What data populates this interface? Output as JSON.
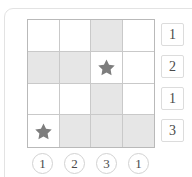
{
  "colors": {
    "cell_shaded": "#e6e6e6",
    "cell_empty": "#ffffff",
    "grid_line": "#c9c9c9",
    "grid_border": "#b9b9b9",
    "star_fill": "#7d7d7d",
    "label_text": "#4a4a4a",
    "card_border": "#e3e3e3"
  },
  "puzzle": {
    "rows": 4,
    "cols": 4,
    "star_icon_name": "star-icon",
    "row_labels": [
      "1",
      "2",
      "1",
      "3"
    ],
    "col_labels": [
      "1",
      "2",
      "3",
      "1"
    ],
    "cells": [
      [
        {
          "shaded": false,
          "star": false
        },
        {
          "shaded": false,
          "star": false
        },
        {
          "shaded": true,
          "star": false
        },
        {
          "shaded": false,
          "star": false
        }
      ],
      [
        {
          "shaded": true,
          "star": false
        },
        {
          "shaded": true,
          "star": false
        },
        {
          "shaded": false,
          "star": true
        },
        {
          "shaded": false,
          "star": false
        }
      ],
      [
        {
          "shaded": false,
          "star": false
        },
        {
          "shaded": false,
          "star": false
        },
        {
          "shaded": true,
          "star": false
        },
        {
          "shaded": false,
          "star": false
        }
      ],
      [
        {
          "shaded": false,
          "star": true
        },
        {
          "shaded": true,
          "star": false
        },
        {
          "shaded": true,
          "star": false
        },
        {
          "shaded": true,
          "star": false
        }
      ]
    ]
  }
}
